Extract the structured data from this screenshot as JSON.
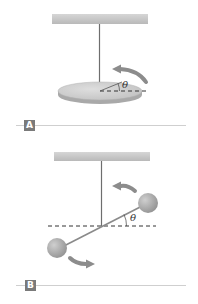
{
  "figure": {
    "panels": [
      {
        "id": "A",
        "label": "A",
        "description": "Torsion pendulum: disk suspended by wire",
        "angle_symbol": "θ"
      },
      {
        "id": "B",
        "label": "B",
        "description": "Torsion pendulum: dumbbell (two spheres on a rod) suspended by wire",
        "angle_symbol": "θ"
      }
    ]
  },
  "colors": {
    "ceiling": "#c8c8c8",
    "wire": "#6e6e6e",
    "disk_top": "#cfcfcf",
    "disk_edge": "#a9a9a9",
    "sphere": "#a8a8a8",
    "arrow": "#8c8c8c",
    "label_box": "#7a7a7a",
    "divider": "#cfcfcf"
  }
}
